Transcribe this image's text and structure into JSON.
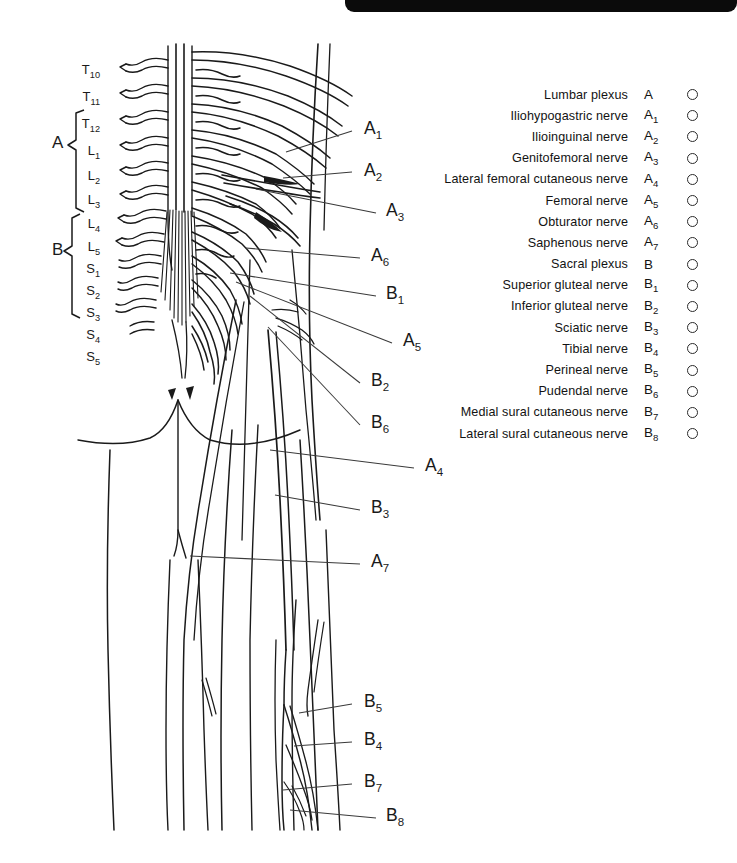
{
  "page": {
    "background_color": "#ffffff",
    "ink_color": "#1a1a1a"
  },
  "top_bar": {
    "present": true,
    "color": "#0b0b0b"
  },
  "legend": {
    "rows": [
      {
        "name": "Lumbar plexus",
        "code": "A",
        "sub": "",
        "marked": false
      },
      {
        "name": "Iliohypogastric nerve",
        "code": "A",
        "sub": "1",
        "marked": false
      },
      {
        "name": "Ilioinguinal nerve",
        "code": "A",
        "sub": "2",
        "marked": false
      },
      {
        "name": "Genitofemoral nerve",
        "code": "A",
        "sub": "3",
        "marked": false
      },
      {
        "name": "Lateral femoral cutaneous nerve",
        "code": "A",
        "sub": "4",
        "marked": false
      },
      {
        "name": "Femoral nerve",
        "code": "A",
        "sub": "5",
        "marked": false
      },
      {
        "name": "Obturator nerve",
        "code": "A",
        "sub": "6",
        "marked": false
      },
      {
        "name": "Saphenous nerve",
        "code": "A",
        "sub": "7",
        "marked": false
      },
      {
        "name": "Sacral plexus",
        "code": "B",
        "sub": "",
        "marked": false
      },
      {
        "name": "Superior gluteal nerve",
        "code": "B",
        "sub": "1",
        "marked": false
      },
      {
        "name": "Inferior gluteal nerve",
        "code": "B",
        "sub": "2",
        "marked": false
      },
      {
        "name": "Sciatic nerve",
        "code": "B",
        "sub": "3",
        "marked": false
      },
      {
        "name": "Tibial nerve",
        "code": "B",
        "sub": "4",
        "marked": false
      },
      {
        "name": "Perineal nerve",
        "code": "B",
        "sub": "5",
        "marked": false
      },
      {
        "name": "Pudendal nerve",
        "code": "B",
        "sub": "6",
        "marked": false
      },
      {
        "name": "Medial sural cutaneous nerve",
        "code": "B",
        "sub": "7",
        "marked": false
      },
      {
        "name": "Lateral sural cutaneous nerve",
        "code": "B",
        "sub": "8",
        "marked": false
      }
    ]
  },
  "vertebral_levels": [
    {
      "letter": "T",
      "sub": "10",
      "x": 100,
      "y": 62
    },
    {
      "letter": "T",
      "sub": "11",
      "x": 100,
      "y": 89
    },
    {
      "letter": "T",
      "sub": "12",
      "x": 100,
      "y": 116
    },
    {
      "letter": "L",
      "sub": "1",
      "x": 100,
      "y": 143
    },
    {
      "letter": "L",
      "sub": "2",
      "x": 100,
      "y": 168
    },
    {
      "letter": "L",
      "sub": "3",
      "x": 100,
      "y": 192
    },
    {
      "letter": "L",
      "sub": "4",
      "x": 100,
      "y": 216
    },
    {
      "letter": "L",
      "sub": "5",
      "x": 100,
      "y": 239
    },
    {
      "letter": "S",
      "sub": "1",
      "x": 100,
      "y": 261
    },
    {
      "letter": "S",
      "sub": "2",
      "x": 100,
      "y": 283
    },
    {
      "letter": "S",
      "sub": "3",
      "x": 100,
      "y": 305
    },
    {
      "letter": "S",
      "sub": "4",
      "x": 100,
      "y": 327
    },
    {
      "letter": "S",
      "sub": "5",
      "x": 100,
      "y": 349
    }
  ],
  "bracket_groups": [
    {
      "label": "A",
      "x": 52,
      "y": 144,
      "span_top": 110,
      "span_bottom": 212
    },
    {
      "label": "B",
      "x": 52,
      "y": 251,
      "span_top": 214,
      "span_bottom": 318
    }
  ],
  "callouts": [
    {
      "code": "A",
      "sub": "1",
      "label_x": 364,
      "label_y": 118,
      "line_x1": 352,
      "line_y1": 131,
      "line_x2": 286,
      "line_y2": 152
    },
    {
      "code": "A",
      "sub": "2",
      "label_x": 364,
      "label_y": 160,
      "line_x1": 352,
      "line_y1": 172,
      "line_x2": 283,
      "line_y2": 178
    },
    {
      "code": "A",
      "sub": "3",
      "label_x": 386,
      "label_y": 200,
      "line_x1": 376,
      "line_y1": 213,
      "line_x2": 256,
      "line_y2": 189
    },
    {
      "code": "A",
      "sub": "6",
      "label_x": 371,
      "label_y": 245,
      "line_x1": 360,
      "line_y1": 258,
      "line_x2": 246,
      "line_y2": 248
    },
    {
      "code": "B",
      "sub": "1",
      "label_x": 386,
      "label_y": 283,
      "line_x1": 376,
      "line_y1": 296,
      "line_x2": 230,
      "line_y2": 273
    },
    {
      "code": "A",
      "sub": "5",
      "label_x": 403,
      "label_y": 330,
      "line_x1": 392,
      "line_y1": 343,
      "line_x2": 236,
      "line_y2": 282
    },
    {
      "code": "B",
      "sub": "2",
      "label_x": 371,
      "label_y": 370,
      "line_x1": 360,
      "line_y1": 383,
      "line_x2": 250,
      "line_y2": 296
    },
    {
      "code": "B",
      "sub": "6",
      "label_x": 371,
      "label_y": 412,
      "line_x1": 360,
      "line_y1": 425,
      "line_x2": 268,
      "line_y2": 327
    },
    {
      "code": "A",
      "sub": "4",
      "label_x": 425,
      "label_y": 455,
      "line_x1": 414,
      "line_y1": 468,
      "line_x2": 270,
      "line_y2": 450
    },
    {
      "code": "B",
      "sub": "3",
      "label_x": 371,
      "label_y": 497,
      "line_x1": 360,
      "line_y1": 510,
      "line_x2": 275,
      "line_y2": 495
    },
    {
      "code": "A",
      "sub": "7",
      "label_x": 371,
      "label_y": 551,
      "line_x1": 360,
      "line_y1": 564,
      "line_x2": 190,
      "line_y2": 556
    },
    {
      "code": "B",
      "sub": "5",
      "label_x": 364,
      "label_y": 691,
      "line_x1": 352,
      "line_y1": 704,
      "line_x2": 299,
      "line_y2": 713
    },
    {
      "code": "B",
      "sub": "4",
      "label_x": 364,
      "label_y": 729,
      "line_x1": 352,
      "line_y1": 742,
      "line_x2": 294,
      "line_y2": 746
    },
    {
      "code": "B",
      "sub": "7",
      "label_x": 364,
      "label_y": 771,
      "line_x1": 352,
      "line_y1": 784,
      "line_x2": 283,
      "line_y2": 790
    },
    {
      "code": "B",
      "sub": "8",
      "label_x": 386,
      "label_y": 805,
      "line_x1": 376,
      "line_y1": 818,
      "line_x2": 290,
      "line_y2": 810
    }
  ]
}
